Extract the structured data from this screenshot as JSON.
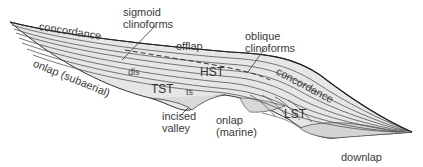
{
  "diagram": {
    "colors": {
      "fill": "#e3e3e3",
      "fill_light": "#ececec",
      "line": "#555555",
      "outline": "#333333",
      "text": "#3a3a3a"
    },
    "labels": {
      "concordance_top": "concordance",
      "sigmoid_line1": "sigmoid",
      "sigmoid_line2": "clinoforms",
      "offlap": "offlap",
      "oblique_line1": "oblique",
      "oblique_line2": "clinoforms",
      "concordance_right": "concordance",
      "onlap_subaerial": "onlap (subaerial)",
      "dls": "dls",
      "hst": "HST",
      "tst": "TST",
      "ts": "ts",
      "incised_line1": "incised",
      "incised_line2": "valley",
      "onlap_marine_line1": "onlap",
      "onlap_marine_line2": "(marine)",
      "lst": "LST",
      "downlap": "downlap"
    }
  }
}
